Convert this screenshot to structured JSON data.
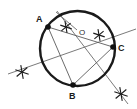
{
  "figure": {
    "background_color": "#ffffff",
    "stroke_color": "#1a1a1a",
    "construction_line_color": "#6b6b6b",
    "point_fill_color": "#111111"
  },
  "circle": {
    "label": "circle",
    "center_x": 77.5,
    "center_y": 48.5,
    "radius": 37.5,
    "stroke_width": 2.4
  },
  "center_point": {
    "name": "O",
    "label": "O",
    "label_x": 79,
    "label_y": 35
  },
  "points": [
    {
      "name": "A",
      "label": "A",
      "x": 48,
      "y": 27,
      "label_x": 36,
      "label_y": 22,
      "radius": 2.8
    },
    {
      "name": "B",
      "label": "B",
      "x": 73,
      "y": 85,
      "label_x": 69,
      "label_y": 99,
      "radius": 2.8
    },
    {
      "name": "C",
      "label": "C",
      "x": 113,
      "y": 47,
      "label_x": 118,
      "label_y": 51,
      "radius": 2.8
    }
  ],
  "chords": [
    {
      "name": "chord-a-b",
      "x1": 48,
      "y1": 27,
      "x2": 73,
      "y2": 85
    },
    {
      "name": "chord-b-c",
      "x1": 73,
      "y1": 85,
      "x2": 113,
      "y2": 47
    },
    {
      "name": "chord-a-c",
      "x1": 48,
      "y1": 27,
      "x2": 113,
      "y2": 47
    }
  ],
  "construction_lines": [
    {
      "name": "bisector-line-long",
      "x1": 8,
      "y1": 74,
      "x2": 136,
      "y2": 29
    },
    {
      "name": "bisector-line-b-c",
      "x1": 57,
      "y1": 11,
      "x2": 128,
      "y2": 104
    },
    {
      "name": "short-arc-line-top",
      "x1": 56,
      "y1": 12,
      "x2": 77,
      "y2": 30
    }
  ],
  "arc_marks": [
    {
      "name": "arc-mark-top",
      "x": 66,
      "y": 27,
      "size": 6
    },
    {
      "name": "arc-mark-right",
      "x": 99,
      "y": 35,
      "size": 6
    },
    {
      "name": "arc-mark-left-outer",
      "x": 22,
      "y": 72,
      "size": 7
    },
    {
      "name": "arc-mark-bottom-right-outer",
      "x": 121,
      "y": 94,
      "size": 7
    }
  ]
}
